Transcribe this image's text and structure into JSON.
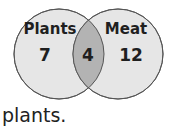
{
  "venn": {
    "sets": [
      {
        "label": "Plants",
        "only_count": "7"
      },
      {
        "label": "Meat",
        "only_count": "12"
      }
    ],
    "intersection_count": "4"
  },
  "caption": "plants.",
  "colors": {
    "circle_fill": "#e6e6e6",
    "overlap_fill": "#b3b3b3",
    "stroke": "#555555"
  }
}
